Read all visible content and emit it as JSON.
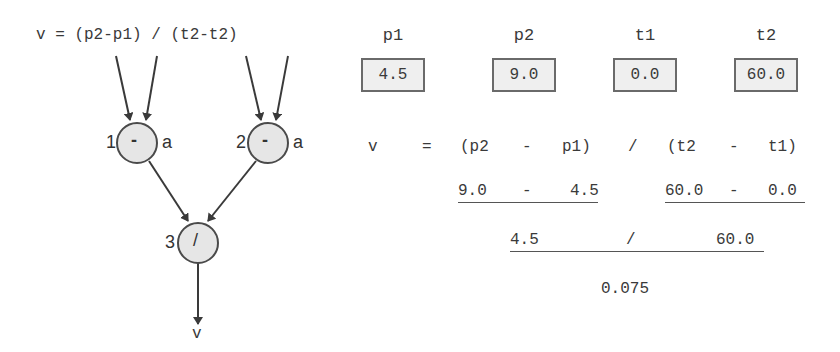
{
  "diagram": {
    "formula": "v = (p2-p1) / (t2-t2)",
    "nodes": [
      {
        "id": "1",
        "op": "-",
        "annotation": "a"
      },
      {
        "id": "2",
        "op": "-",
        "annotation": "a"
      },
      {
        "id": "3",
        "op": "/",
        "annotation": ""
      }
    ],
    "output": "v",
    "colors": {
      "node_fill": "#e6e6e6",
      "stroke": "#4a4a4a"
    }
  },
  "variables": [
    {
      "name": "p1",
      "value": "4.5"
    },
    {
      "name": "p2",
      "value": "9.0"
    },
    {
      "name": "t1",
      "value": "0.0"
    },
    {
      "name": "t2",
      "value": "60.0"
    }
  ],
  "evaluation": {
    "row1": {
      "lhs": "v",
      "eq": "=",
      "open1": "(p2",
      "minus1": "-",
      "close1": "p1)",
      "div": "/",
      "open2": "(t2",
      "minus2": "-",
      "close2": "t1)"
    },
    "row2": {
      "a": "9.0",
      "minus1": "-",
      "b": "4.5",
      "c": "60.0",
      "minus2": "-",
      "d": "0.0"
    },
    "row3": {
      "a": "4.5",
      "div": "/",
      "b": "60.0"
    },
    "result": "0.075"
  }
}
